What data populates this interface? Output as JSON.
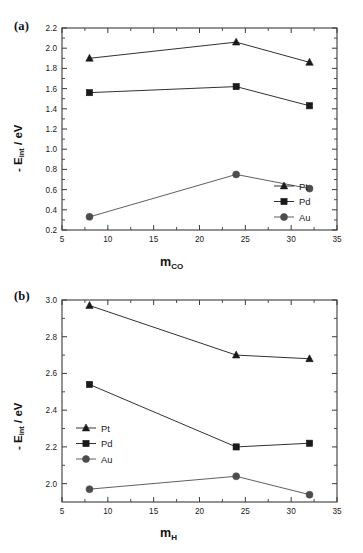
{
  "figure": {
    "panels": [
      {
        "tag": "(a)",
        "ylabel_prefix": "- E",
        "ylabel_sub": "int",
        "ylabel_suffix": " / eV",
        "xlabel_main": "m",
        "xlabel_sub": "CO",
        "legend_position": "bottom-right"
      },
      {
        "tag": "(b)",
        "ylabel_prefix": "- E",
        "ylabel_sub": "int",
        "ylabel_suffix": " / eV",
        "xlabel_main": "m",
        "xlabel_sub": "H",
        "legend_position": "middle-left"
      }
    ]
  },
  "chart_data": [
    {
      "type": "line",
      "panel": "(a)",
      "title": "",
      "xlabel": "m_CO",
      "ylabel": "- E_int / eV",
      "x": [
        8,
        24,
        32
      ],
      "xlim": [
        5,
        35
      ],
      "ylim": [
        0.2,
        2.2
      ],
      "xticks": [
        5,
        10,
        15,
        20,
        25,
        30,
        35
      ],
      "xticklabels": [
        "5",
        "10",
        "15",
        "20",
        "25",
        "30",
        "35"
      ],
      "yticks": [
        0.2,
        0.4,
        0.6,
        0.8,
        1.0,
        1.2,
        1.4,
        1.6,
        1.8,
        2.0,
        2.2
      ],
      "yticklabels": [
        "0.2",
        "0.4",
        "0.6",
        "0.8",
        "1.0",
        "1.2",
        "1.4",
        "1.6",
        "1.8",
        "2.0",
        "2.2"
      ],
      "grid": false,
      "legend_position": "lower right",
      "series": [
        {
          "name": "Pt",
          "marker": "triangle",
          "color": "#1a1a1a",
          "values": [
            1.9,
            2.06,
            1.86
          ]
        },
        {
          "name": "Pd",
          "marker": "square",
          "color": "#1a1a1a",
          "values": [
            1.56,
            1.62,
            1.43
          ]
        },
        {
          "name": "Au",
          "marker": "circle",
          "color": "#4d4d4d",
          "values": [
            0.33,
            0.75,
            0.61
          ]
        }
      ]
    },
    {
      "type": "line",
      "panel": "(b)",
      "title": "",
      "xlabel": "m_H",
      "ylabel": "- E_int / eV",
      "x": [
        8,
        24,
        32
      ],
      "xlim": [
        5,
        35
      ],
      "ylim": [
        1.9,
        3.0
      ],
      "xticks": [
        5,
        10,
        15,
        20,
        25,
        30,
        35
      ],
      "xticklabels": [
        "5",
        "10",
        "15",
        "20",
        "25",
        "30",
        "35"
      ],
      "yticks": [
        2.0,
        2.2,
        2.4,
        2.6,
        2.8,
        3.0
      ],
      "yticklabels": [
        "2.0",
        "2.2",
        "2.4",
        "2.6",
        "2.8",
        "3.0"
      ],
      "grid": false,
      "legend_position": "center left",
      "series": [
        {
          "name": "Pt",
          "marker": "triangle",
          "color": "#1a1a1a",
          "values": [
            2.97,
            2.7,
            2.68
          ]
        },
        {
          "name": "Pd",
          "marker": "square",
          "color": "#1a1a1a",
          "values": [
            2.54,
            2.2,
            2.22
          ]
        },
        {
          "name": "Au",
          "marker": "circle",
          "color": "#4d4d4d",
          "values": [
            1.97,
            2.04,
            1.94
          ]
        }
      ]
    }
  ]
}
